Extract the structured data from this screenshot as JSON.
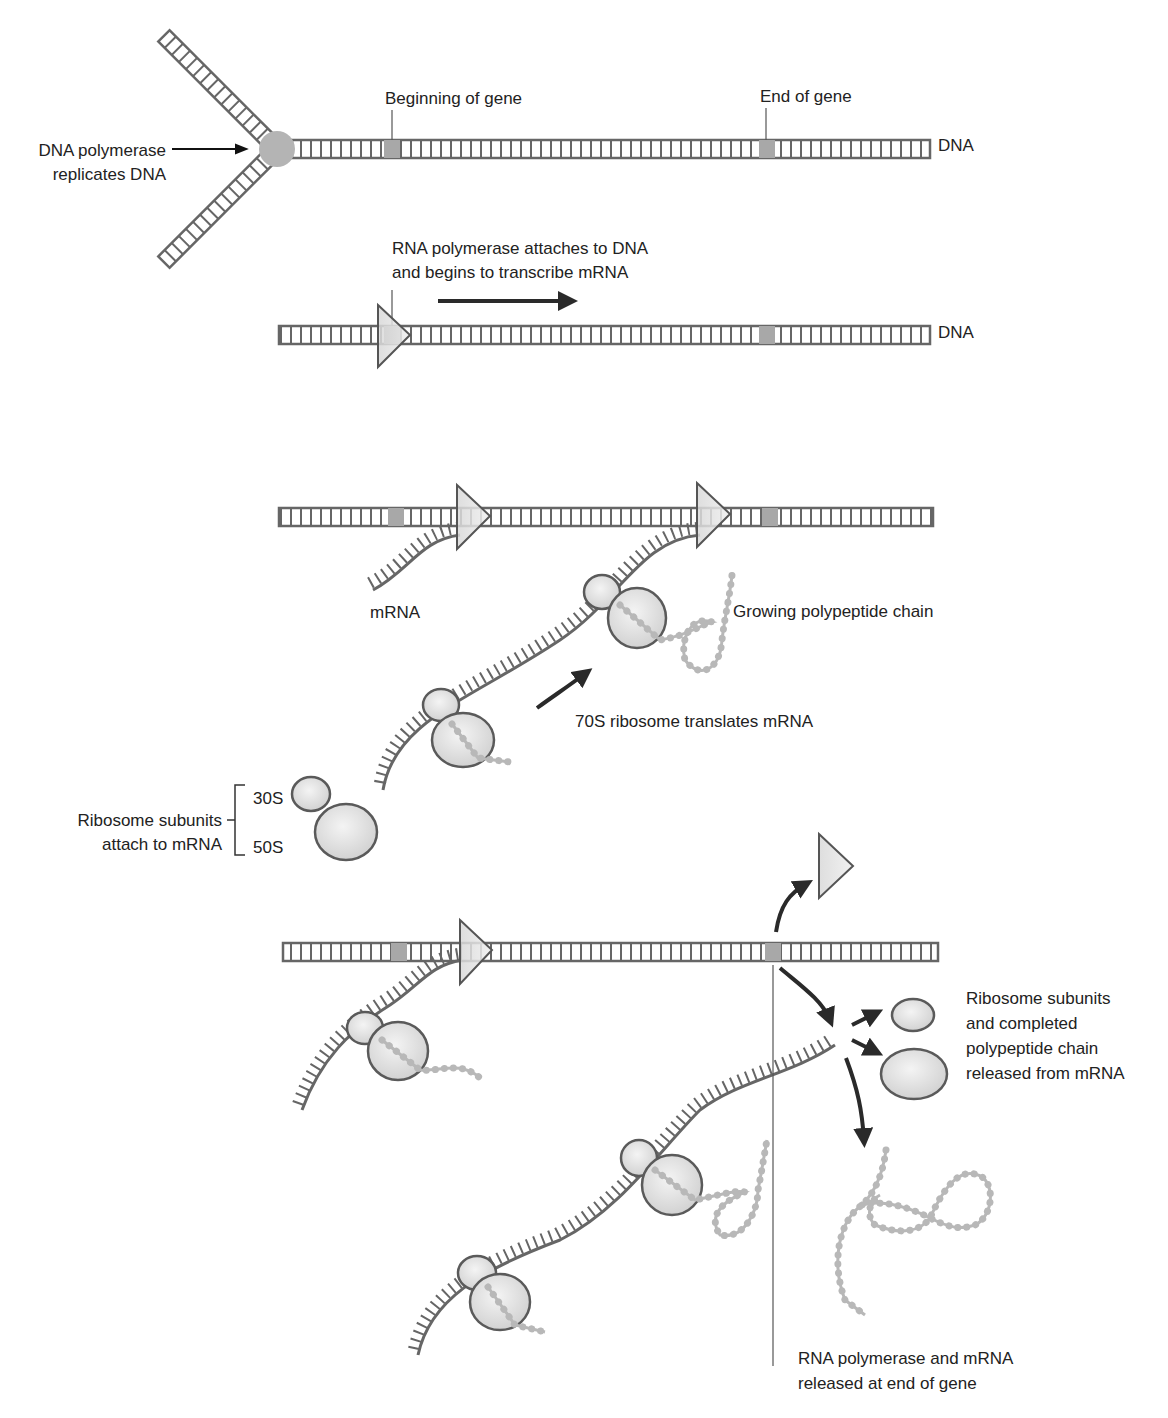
{
  "colors": {
    "strand": "#666666",
    "gene_marker": "#a8a8a8",
    "polymerase_fill": "#b4b4b4",
    "ribosome_fill": "#e2e2e2",
    "ribosome_stroke": "#5a5a5a",
    "polypeptide": "#b8b8b8",
    "arrow": "#2a2a2a",
    "text": "#222222"
  },
  "panel1": {
    "dna_polymerase_label_line1": "DNA polymerase",
    "dna_polymerase_label_line2": "replicates DNA",
    "beginning_of_gene": "Beginning of gene",
    "end_of_gene": "End of gene",
    "dna_label": "DNA"
  },
  "panel2": {
    "rna_polymerase_line1": "RNA polymerase attaches to DNA",
    "rna_polymerase_line2": "and begins to transcribe mRNA",
    "dna_label": "DNA"
  },
  "panel3": {
    "mrna_label": "mRNA",
    "growing_chain": "Growing polypeptide chain",
    "ribosome_translates": "70S ribosome translates mRNA",
    "subunits_line1": "Ribosome subunits",
    "subunits_line2": "attach to mRNA",
    "subunit_small": "30S",
    "subunit_large": "50S"
  },
  "panel4": {
    "released_line1": "Ribosome subunits",
    "released_line2": "and completed",
    "released_line3": "polypeptide chain",
    "released_line4": "released from mRNA",
    "rna_pol_released_line1": "RNA polymerase and mRNA",
    "rna_pol_released_line2": "released at end of gene"
  }
}
